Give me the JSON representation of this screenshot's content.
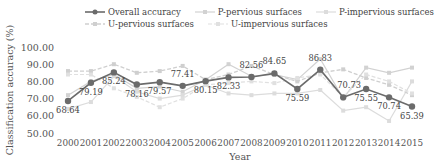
{
  "chart_data": {
    "type": "line",
    "title": "",
    "xlabel": "Year",
    "ylabel": "Classification accuracy (%)",
    "ylim": [
      50,
      100
    ],
    "yticks": [
      "50.00",
      "60.00",
      "70.00",
      "80.00",
      "90.00",
      "100.00"
    ],
    "categories": [
      "2000",
      "2001",
      "2002",
      "2003",
      "2004",
      "2005",
      "2006",
      "2007",
      "2008",
      "2009",
      "2010",
      "2011",
      "2012",
      "2013",
      "2014",
      "2015"
    ],
    "series": [
      {
        "name": "Overall accuracy",
        "color": "#6b6b6b",
        "dash": "",
        "width": 1.6,
        "marker_r": 3.2,
        "values": [
          68.64,
          79.19,
          85.24,
          78.16,
          79.57,
          77.41,
          80.15,
          82.33,
          82.56,
          84.65,
          75.59,
          86.83,
          70.73,
          75.55,
          70.74,
          65.39
        ],
        "labels": [
          "68.64",
          "79.19",
          "85.24",
          "78.16",
          "79.57",
          "77.41",
          "80.15",
          "82.33",
          "82.56",
          "84.65",
          "75.59",
          "86.83",
          "70.73",
          "75.55",
          "70.74",
          "65.39"
        ]
      },
      {
        "name": "P-pervious surfaces",
        "color": "#d2d2d2",
        "dash": "",
        "width": 1.2,
        "marker_r": 2,
        "values": [
          72,
          80,
          84,
          76,
          77,
          74,
          81,
          90,
          83,
          84,
          81,
          93,
          70,
          88,
          85,
          88
        ]
      },
      {
        "name": "P-impervious surfaces",
        "color": "#dcdcdc",
        "dash": "",
        "width": 1.2,
        "marker_r": 2,
        "values": [
          64,
          68,
          83,
          74,
          70,
          72,
          78,
          73,
          72,
          73,
          73,
          75,
          63,
          65,
          57,
          80
        ]
      },
      {
        "name": "U-pervious surfaces",
        "color": "#cfcfcf",
        "dash": "4,2",
        "width": 1.3,
        "marker_r": 2,
        "values": [
          86,
          86,
          90,
          85,
          86,
          89,
          81,
          84,
          89,
          84,
          80,
          85,
          87,
          82,
          78,
          72
        ]
      },
      {
        "name": "U-impervious surfaces",
        "color": "#e0e0e0",
        "dash": "4,2",
        "width": 1.2,
        "marker_r": 2,
        "values": [
          84,
          84,
          76,
          71,
          65,
          70,
          78,
          79,
          80,
          79,
          82,
          84,
          71,
          84,
          80,
          73
        ]
      }
    ],
    "legend_position": "top",
    "grid": false
  },
  "legend": {
    "items": [
      {
        "label": "Overall accuracy",
        "color": "#6b6b6b",
        "dash": false
      },
      {
        "label": "P-pervious surfaces",
        "color": "#d2d2d2",
        "dash": false
      },
      {
        "label": "P-impervious surfaces",
        "color": "#dcdcdc",
        "dash": false
      },
      {
        "label": "U-pervious surfaces",
        "color": "#cfcfcf",
        "dash": true
      },
      {
        "label": "U-impervious surfaces",
        "color": "#e0e0e0",
        "dash": true
      }
    ]
  }
}
